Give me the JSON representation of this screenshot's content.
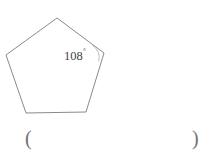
{
  "figure": {
    "type": "regular-pentagon",
    "shape_name": "pentagon",
    "stroke_color": "#8a8a8a",
    "background_color": "#ffffff",
    "vertices": [
      {
        "name": "top",
        "x": 57,
        "y": 18
      },
      {
        "name": "right",
        "x": 104,
        "y": 53
      },
      {
        "name": "bottom-right",
        "x": 86,
        "y": 112
      },
      {
        "name": "bottom-left",
        "x": 26,
        "y": 113
      },
      {
        "name": "left",
        "x": 6,
        "y": 55
      }
    ],
    "angle_label": {
      "value": "108",
      "degree_symbol": "°",
      "full_text": "108°",
      "at_vertex": "right",
      "text_color": "#444444",
      "arc_color": "#bdbdbd"
    }
  },
  "answer_blank": {
    "open_paren": "(",
    "close_paren": ")",
    "value": ""
  },
  "chart_data": {
    "type": "diagram",
    "title": "",
    "shape": "regular pentagon",
    "labels": [
      "108°"
    ],
    "annotations": [
      "108° interior angle marked at upper-right vertex"
    ],
    "vertices": [
      [
        57,
        18
      ],
      [
        104,
        53
      ],
      [
        86,
        112
      ],
      [
        26,
        113
      ],
      [
        6,
        55
      ]
    ]
  }
}
